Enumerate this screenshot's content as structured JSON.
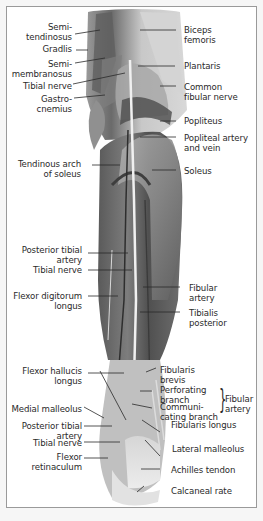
{
  "figure": {
    "colors": {
      "frame_border": "#9a9a9a",
      "background": "#ffffff",
      "muscle_dark": "#4e4e4e",
      "muscle_mid": "#7b7b7b",
      "tendon_light": "#e6e6e6",
      "leader_line": "#2a2a2a",
      "text": "#2a2a2a"
    },
    "labels_left": [
      {
        "id": "semitendinosus",
        "text": "Semi-\ntendinosus"
      },
      {
        "id": "gracilis",
        "text": "Gradlis"
      },
      {
        "id": "semimembranosus",
        "text": "Semi-\nmembranosus"
      },
      {
        "id": "tibial-nerve-upper",
        "text": "Tibial nerve"
      },
      {
        "id": "gastrocnemius",
        "text": "Gastro-\ncnemius"
      },
      {
        "id": "tendinous-arch-soleus",
        "text": "Tendinous arch\nof soleus"
      },
      {
        "id": "posterior-tibial-artery-upper",
        "text": "Posterior tibial\nartery"
      },
      {
        "id": "tibial-nerve-middle",
        "text": "Tibial nerve"
      },
      {
        "id": "flexor-digitorum-longus",
        "text": "Flexor digitorum\nlongus"
      },
      {
        "id": "flexor-hallucis-longus",
        "text": "Flexor hallucis\nlongus"
      },
      {
        "id": "medial-malleolus",
        "text": "Medial malleolus"
      },
      {
        "id": "posterior-tibial-artery-lower",
        "text": "Posterior tibial\nartery"
      },
      {
        "id": "tibial-nerve-lower",
        "text": "Tibial nerve"
      },
      {
        "id": "flexor-retinaculum",
        "text": "Flexor\nretinaculum"
      }
    ],
    "labels_right": [
      {
        "id": "biceps-femoris",
        "text": "Biceps\nfemoris"
      },
      {
        "id": "plantaris",
        "text": "Plantaris"
      },
      {
        "id": "common-fibular-nerve",
        "text": "Common\nfibular nerve"
      },
      {
        "id": "popliteus",
        "text": "Popliteus"
      },
      {
        "id": "popliteal-artery-vein",
        "text": "Popliteal artery\nand vein"
      },
      {
        "id": "soleus",
        "text": "Soleus"
      },
      {
        "id": "fibular-artery",
        "text": "Fibular\nartery"
      },
      {
        "id": "tibialis-posterior",
        "text": "Tibialis\nposterior"
      },
      {
        "id": "fibularis-brevis",
        "text": "Fibularis\nbrevis"
      },
      {
        "id": "perforating-branch",
        "text": "Perforating\nbranch"
      },
      {
        "id": "communicating-branch",
        "text": "Communi-\ncating branch"
      },
      {
        "id": "fibularis-longus",
        "text": "Fibularis longus"
      },
      {
        "id": "lateral-malleolus",
        "text": "Lateral malleolus"
      },
      {
        "id": "achilles-tendon",
        "text": "Achilles tendon"
      },
      {
        "id": "calcaneal-rate",
        "text": "Calcaneal rate"
      }
    ],
    "group_brace": {
      "text": "Fibular\nartery",
      "groups": [
        "perforating-branch",
        "communicating-branch"
      ]
    }
  }
}
